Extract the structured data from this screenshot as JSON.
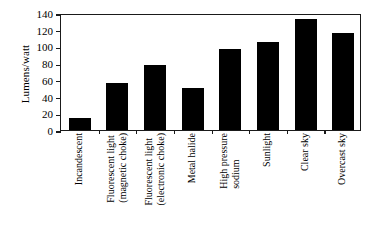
{
  "chart_data": {
    "type": "bar",
    "title": "",
    "xlabel": "",
    "ylabel": "Lumens/watt",
    "ylim": [
      0,
      140
    ],
    "ytick_step": 20,
    "yticks": [
      0,
      20,
      40,
      60,
      80,
      100,
      120,
      140
    ],
    "ytick_labels": [
      "0",
      "20",
      "40",
      "60",
      "80",
      "100",
      "120",
      "140"
    ],
    "grid": false,
    "legend": null,
    "bar_color": "#000000",
    "axis_color": "#1a1a1a",
    "background": "#ffffff",
    "categories": [
      "Incandescent",
      "Fluorescent light (magnetic choke)",
      "Fluorescent light (electronic choke)",
      "Metal halide",
      "High pressure sodium",
      "Sunlight",
      "Clear sky",
      "Overcast sky"
    ],
    "category_lines": [
      [
        "Incandescent"
      ],
      [
        "Fluorescent light",
        "(magnetic choke)"
      ],
      [
        "Fluorescent light",
        "(electronic choke)"
      ],
      [
        "Metal halide"
      ],
      [
        "High pressure",
        "sodium"
      ],
      [
        "Sunlight"
      ],
      [
        "Clear sky"
      ],
      [
        "Overcast sky"
      ]
    ],
    "values": [
      14,
      56,
      78,
      50,
      97,
      105,
      133,
      116
    ]
  }
}
